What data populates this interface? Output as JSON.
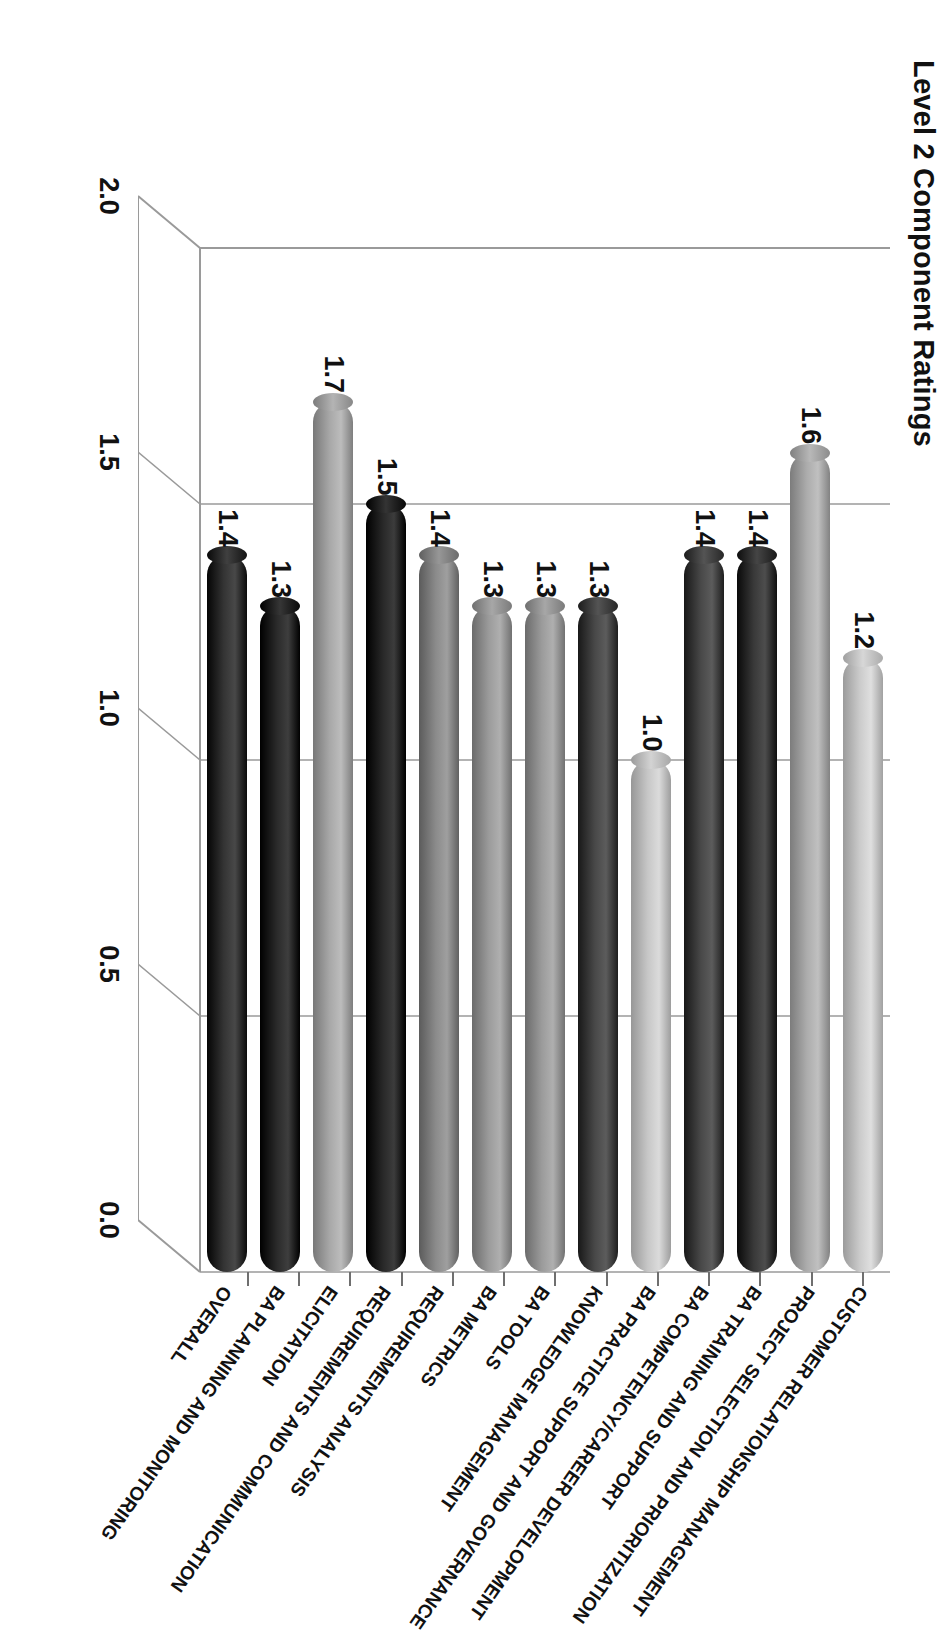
{
  "chart": {
    "title": "Level 2 Component Ratings",
    "value_axis": {
      "ticks": [
        "0.0",
        "0.5",
        "1.0",
        "1.5",
        "2.0"
      ],
      "min": 0.0,
      "max": 2.0
    }
  },
  "chart_data": {
    "type": "bar",
    "orientation": "horizontal-3d-cylinder",
    "title": "Level 2 Component Ratings",
    "xlabel": "",
    "ylabel": "",
    "ylim": [
      0.0,
      2.0
    ],
    "grid": true,
    "legend": "none",
    "categories": [
      "OVERALL",
      "BA PLANNING AND MONITORING",
      "ELICITATION",
      "REQUIREMENTS AND COMMUNICATION",
      "REQUIREMENTS ANALYSIS",
      "BA METRICS",
      "BA TOOLS",
      "KNOWLEDGE MANAGEMENT",
      "BA PRACTICE SUPPORT AND GOVERNANCE",
      "BA COMPETENCY/CAREER DEVELOPMENT",
      "BA TRAINING AND SUPPORT",
      "PROJECT SELECTION AND PRIORITIZATION",
      "CUSTOMER RELATIONSHIP MANAGEMENT"
    ],
    "values": [
      1.4,
      1.3,
      1.7,
      1.5,
      1.4,
      1.3,
      1.3,
      1.3,
      1.0,
      1.4,
      1.4,
      1.6,
      1.2
    ],
    "value_labels": [
      "1.4",
      "1.3",
      "1.7",
      "1.5",
      "1.4",
      "1.3",
      "1.3",
      "1.3",
      "1.0",
      "1.4",
      "1.4",
      "1.6",
      "1.2"
    ],
    "bar_colors": [
      "#262626",
      "#1c1c1c",
      "#9a9a9a",
      "#1a1a1a",
      "#7d7d7d",
      "#8d8d8d",
      "#8d8d8d",
      "#3a3a3a",
      "#b9b9b9",
      "#3a3a3a",
      "#2b2b2b",
      "#9e9e9e",
      "#bdbdbd"
    ],
    "colors_note": {
      "dark": "#1a1a1a",
      "mid": "#8d8d8d",
      "light": "#bdbdbd",
      "grid": "#8c8c8c",
      "text": "#111111"
    }
  }
}
